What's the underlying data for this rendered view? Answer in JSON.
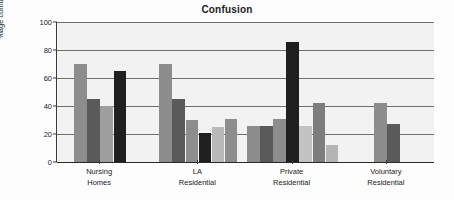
{
  "chart_data": {
    "type": "bar",
    "title": "Confusion",
    "xlabel": "",
    "ylabel": "%age confused",
    "ylim": [
      0,
      100
    ],
    "yticks": [
      0,
      20,
      40,
      60,
      80,
      100
    ],
    "grid": true,
    "legend": "none",
    "categories": [
      "Nursing\nHomes",
      "LA\nResidential",
      "Private\nResidential",
      "Voluntary\nResidential"
    ],
    "category_lines": [
      [
        "Nursing",
        "Homes"
      ],
      [
        "LA",
        "Residential"
      ],
      [
        "Private",
        "Residential"
      ],
      [
        "Voluntary",
        "Residential"
      ]
    ],
    "palette": {
      "medium_gray": "#8d8d8d",
      "dark_gray": "#5a5a5a",
      "light_gray": "#b9b9b9",
      "black": "#1f1f1f"
    },
    "groups": [
      {
        "name": "Nursing Homes",
        "bars": [
          {
            "value": 70,
            "color": "#8d8d8d",
            "tone": "medium_gray"
          },
          {
            "value": 45,
            "color": "#5a5a5a",
            "tone": "dark_gray"
          },
          {
            "value": 40,
            "color": "#9e9e9e",
            "tone": "medium_gray"
          },
          {
            "value": 65,
            "color": "#1f1f1f",
            "tone": "black"
          }
        ]
      },
      {
        "name": "LA Residential",
        "bars": [
          {
            "value": 70,
            "color": "#8d8d8d",
            "tone": "medium_gray"
          },
          {
            "value": 45,
            "color": "#5a5a5a",
            "tone": "dark_gray"
          },
          {
            "value": 30,
            "color": "#8d8d8d",
            "tone": "medium_gray"
          },
          {
            "value": 21,
            "color": "#1f1f1f",
            "tone": "black"
          },
          {
            "value": 25,
            "color": "#b9b9b9",
            "tone": "light_gray"
          },
          {
            "value": 31,
            "color": "#8d8d8d",
            "tone": "medium_gray"
          }
        ]
      },
      {
        "name": "Private Residential",
        "bars": [
          {
            "value": 26,
            "color": "#8d8d8d",
            "tone": "medium_gray"
          },
          {
            "value": 26,
            "color": "#5a5a5a",
            "tone": "dark_gray"
          },
          {
            "value": 31,
            "color": "#8d8d8d",
            "tone": "medium_gray"
          },
          {
            "value": 86,
            "color": "#1f1f1f",
            "tone": "black"
          },
          {
            "value": 26,
            "color": "#c2c2c2",
            "tone": "light_gray"
          },
          {
            "value": 42,
            "color": "#7d7d7d",
            "tone": "medium_gray"
          },
          {
            "value": 12,
            "color": "#b4b4b4",
            "tone": "light_gray"
          }
        ]
      },
      {
        "name": "Voluntary Residential",
        "bars": [
          {
            "value": 42,
            "color": "#8d8d8d",
            "tone": "medium_gray"
          },
          {
            "value": 27,
            "color": "#5a5a5a",
            "tone": "dark_gray"
          }
        ]
      }
    ]
  }
}
